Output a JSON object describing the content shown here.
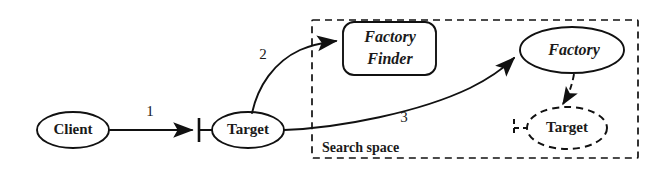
{
  "diagram": {
    "background_color": "#ffffff",
    "stroke_color": "#111111",
    "nodes": {
      "client": {
        "label": "Client",
        "shape": "ellipse",
        "style": "solid"
      },
      "target_proxy": {
        "label": "Target",
        "shape": "ellipse",
        "style": "solid"
      },
      "factory_finder": {
        "label_line1": "Factory",
        "label_line2": "Finder",
        "shape": "rounded-rect",
        "style": "solid"
      },
      "factory": {
        "label": "Factory",
        "shape": "ellipse",
        "style": "solid"
      },
      "target_instance": {
        "label": "Target",
        "shape": "ellipse",
        "style": "dashed"
      }
    },
    "edges": {
      "edge1": {
        "label": "1",
        "from": "client",
        "to": "target_proxy",
        "style": "solid"
      },
      "edge2": {
        "label": "2",
        "from": "target_proxy",
        "to": "factory_finder",
        "style": "solid"
      },
      "edge3": {
        "label": "3",
        "from": "target_proxy",
        "to": "factory",
        "style": "solid"
      },
      "edge4": {
        "label": "",
        "from": "factory",
        "to": "target_instance",
        "style": "dashed"
      }
    },
    "regions": {
      "search_space": {
        "label": "Search space",
        "style": "dashed"
      }
    }
  }
}
